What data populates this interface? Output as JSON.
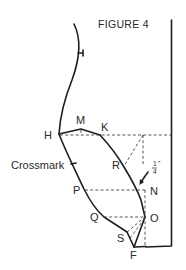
{
  "figure": {
    "title": "FIGURE 4",
    "points": {
      "H": "H",
      "M": "M",
      "K": "K",
      "R": "R",
      "N": "N",
      "P": "P",
      "O": "O",
      "Q": "Q",
      "S": "S",
      "F": "F"
    },
    "annotations": {
      "crossmark": "Crossmark",
      "measure_num": "1",
      "measure_den": "4",
      "measure_unit": "\""
    }
  }
}
